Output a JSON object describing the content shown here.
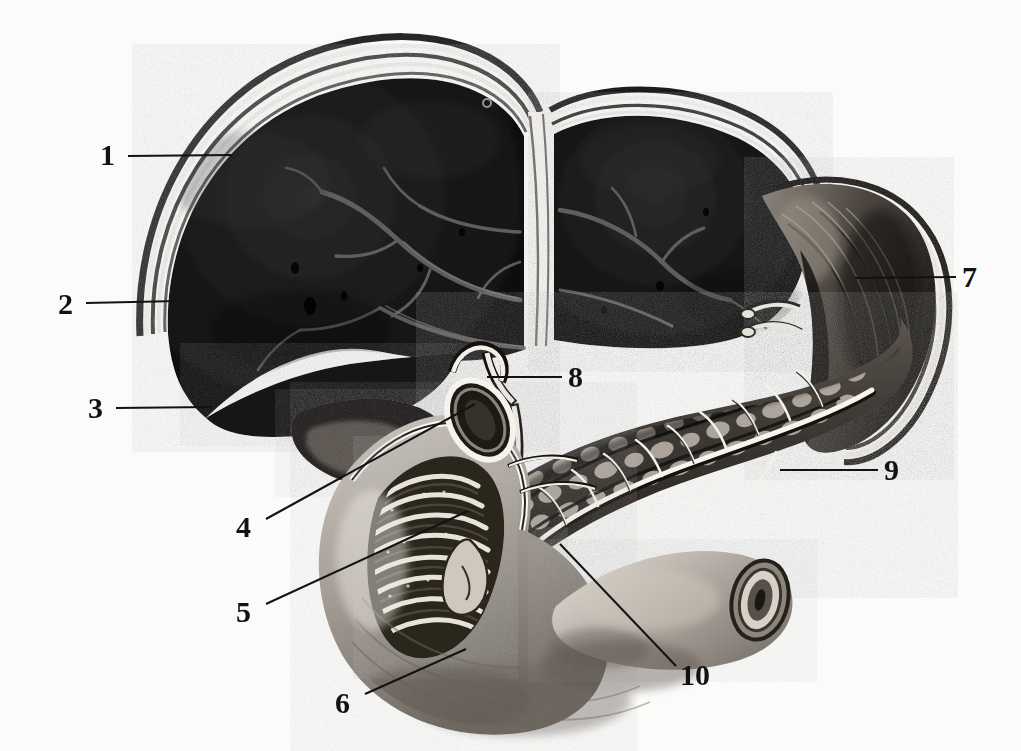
{
  "figure": {
    "style": "engraving / halftone anatomical plate",
    "background_color": "#fbfbfa",
    "ink_color": "#121212",
    "width": 1021,
    "height": 751
  },
  "labels": [
    {
      "id": "1",
      "text": "1",
      "x": 100,
      "y": 140,
      "leader": {
        "x1": 128,
        "y1": 156,
        "x2": 232,
        "y2": 155
      },
      "target": "liver-capsule-upper-right-lobe"
    },
    {
      "id": "2",
      "text": "2",
      "x": 58,
      "y": 289,
      "leader": {
        "x1": 86,
        "y1": 303,
        "x2": 178,
        "y2": 301
      },
      "target": "liver-right-lobe-lateral-border"
    },
    {
      "id": "3",
      "text": "3",
      "x": 88,
      "y": 393,
      "leader": {
        "x1": 116,
        "y1": 408,
        "x2": 212,
        "y2": 407
      },
      "target": "liver-right-lobe-parenchyma"
    },
    {
      "id": "4",
      "text": "4",
      "x": 236,
      "y": 512,
      "leader": {
        "x1": 266,
        "y1": 519,
        "x2": 475,
        "y2": 404
      },
      "target": "cut-duodenum-lumen-opening"
    },
    {
      "id": "5",
      "text": "5",
      "x": 236,
      "y": 597,
      "leader": {
        "x1": 266,
        "y1": 604,
        "x2": 468,
        "y2": 511
      },
      "target": "plicae-circulares-duodenal-mucosa"
    },
    {
      "id": "6",
      "text": "6",
      "x": 335,
      "y": 688,
      "leader": {
        "x1": 365,
        "y1": 694,
        "x2": 466,
        "y2": 649
      },
      "target": "duodenum-inferior-curve"
    },
    {
      "id": "7",
      "text": "7",
      "x": 962,
      "y": 262,
      "leader": {
        "x1": 956,
        "y1": 277,
        "x2": 855,
        "y2": 278
      },
      "target": "spleen-body"
    },
    {
      "id": "8",
      "text": "8",
      "x": 568,
      "y": 362,
      "leader": {
        "x1": 562,
        "y1": 377,
        "x2": 487,
        "y2": 377
      },
      "target": "common-bile-duct-junction"
    },
    {
      "id": "9",
      "text": "9",
      "x": 884,
      "y": 455,
      "leader": {
        "x1": 878,
        "y1": 470,
        "x2": 780,
        "y2": 470
      },
      "target": "pancreas-body-lobules"
    },
    {
      "id": "10",
      "text": "10",
      "x": 680,
      "y": 660,
      "leader": {
        "x1": 676,
        "y1": 666,
        "x2": 560,
        "y2": 544
      },
      "target": "main-pancreatic-duct"
    }
  ],
  "structures": [
    {
      "name": "liver-right-lobe",
      "description": "large dark lobe occupying the upper left of the plate, banded capsule at its convex border"
    },
    {
      "name": "liver-left-lobe",
      "description": "smaller dark lobe to the right of the falciform ligament notch"
    },
    {
      "name": "falciform-ligament",
      "description": "pale vertical cleft separating the two hepatic lobes"
    },
    {
      "name": "hepatic-vein-branches",
      "description": "pale dichotomously branching vessels within the liver substance"
    },
    {
      "name": "gallbladder",
      "description": "pear-shaped body at the inferior liver border with a pale fundus"
    },
    {
      "name": "cystic-duct",
      "description": "short duct leaving the gallbladder neck, joining the hepatic duct"
    },
    {
      "name": "common-bile-duct",
      "description": "descending duct passing behind the duodenum to the papilla"
    },
    {
      "name": "duodenum",
      "description": "C-shaped loop opened anteriorly, lumen shows plicae circulares"
    },
    {
      "name": "duodenal-papilla",
      "description": "eminence where bile and pancreatic ducts open into the duodenum"
    },
    {
      "name": "pancreas",
      "description": "elongated lobulated gland stretching right across the plate"
    },
    {
      "name": "main-pancreatic-duct",
      "description": "pale duct of Wirsung with feathery side tributaries"
    },
    {
      "name": "spleen",
      "description": "curved organ at the far right behind the pancreatic tail"
    }
  ]
}
